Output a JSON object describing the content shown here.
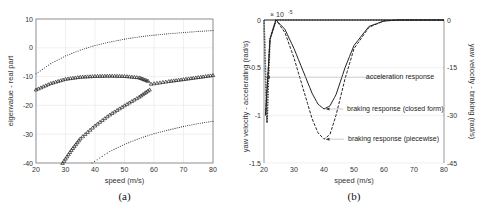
{
  "chart_data": [
    {
      "type": "scatter",
      "panel": "(a)",
      "caption": "(a)",
      "xlabel": "speed (m/s)",
      "ylabel": "eigenvalue - real part",
      "xlim": [
        20,
        80
      ],
      "ylim": [
        -40,
        10
      ],
      "xticks": [
        20,
        30,
        40,
        50,
        60,
        70,
        80
      ],
      "yticks": [
        10,
        0,
        -10,
        -20,
        -30,
        -40
      ],
      "grid": true,
      "series": [
        {
          "name": "upper dotted",
          "style": "dotted",
          "x": [
            20,
            25,
            30,
            35,
            40,
            45,
            50,
            55,
            60,
            65,
            70,
            75,
            80
          ],
          "y": [
            -9,
            -5.5,
            -2.8,
            -0.8,
            0.8,
            2.0,
            3.0,
            3.8,
            4.4,
            4.9,
            5.3,
            5.7,
            6
          ]
        },
        {
          "name": "triangles upper branch",
          "style": "triangle",
          "x": [
            20,
            25,
            30,
            35,
            40,
            45,
            50,
            55,
            58
          ],
          "y": [
            -14.5,
            -12.3,
            -10.8,
            -10.1,
            -9.8,
            -9.7,
            -9.8,
            -10.3,
            -11.5
          ]
        },
        {
          "name": "triangles lower branch",
          "style": "triangle",
          "x": [
            29,
            32,
            35,
            40,
            45,
            50,
            55,
            58.5
          ],
          "y": [
            -40,
            -35.5,
            -31.5,
            -27,
            -23.2,
            -20,
            -17,
            -14.5
          ]
        },
        {
          "name": "triangles merged",
          "style": "triangle",
          "x": [
            59,
            65,
            70,
            75,
            80
          ],
          "y": [
            -12.5,
            -11.6,
            -10.9,
            -10.2,
            -9.5
          ]
        },
        {
          "name": "lower dotted",
          "style": "dotted",
          "x": [
            39,
            45,
            50,
            55,
            60,
            65,
            70,
            75,
            80
          ],
          "y": [
            -40,
            -36,
            -33.5,
            -31.5,
            -29.8,
            -28.5,
            -27.3,
            -26.3,
            -25.5
          ]
        }
      ]
    },
    {
      "type": "line",
      "panel": "(b)",
      "caption": "(b)",
      "xlabel": "speed (m/s)",
      "ylabel_left": "yaw velocity - accelerating (rad/s)",
      "ylabel_right": "yaw velocity - braking (rad/s)",
      "left_scale_label": "× 10^-5",
      "xlim": [
        20,
        80
      ],
      "ylim_left": [
        -1.5,
        0
      ],
      "ylim_right": [
        -45,
        0
      ],
      "xticks": [
        20,
        30,
        40,
        50,
        60,
        70,
        80
      ],
      "yticks_left": [
        0,
        -0.5,
        -1,
        -1.5
      ],
      "yticks_right": [
        0,
        -15,
        -30,
        -45
      ],
      "grid": true,
      "annotations": [
        "acceleration response",
        "braking response (closed form)",
        "braking response (piecewise)"
      ],
      "series": [
        {
          "name": "acceleration response",
          "style": "dotted",
          "x": [
            20,
            20.3,
            20.6,
            21,
            21.5,
            22,
            24,
            30,
            80
          ],
          "y": [
            0,
            -0.3,
            -0.7,
            -1.08,
            -0.6,
            -0.2,
            0,
            0,
            0
          ]
        },
        {
          "name": "braking response (closed form)",
          "axis": "right",
          "style": "solid",
          "x": [
            20.5,
            22,
            24,
            27,
            30,
            33,
            36,
            38,
            40,
            42,
            44,
            47,
            50,
            55,
            60,
            65,
            80
          ],
          "y": [
            -30,
            -6,
            0,
            -3,
            -9,
            -16,
            -23,
            -26.5,
            -28,
            -27,
            -23.5,
            -15,
            -8,
            -2,
            -0.3,
            0,
            0
          ]
        },
        {
          "name": "braking response (piecewise)",
          "axis": "right",
          "style": "dashed",
          "x": [
            20.5,
            22,
            24,
            27,
            30,
            33,
            36,
            38,
            40,
            42,
            44,
            47,
            50,
            55,
            60,
            65,
            80
          ],
          "y": [
            -30,
            -6,
            0,
            -4,
            -12,
            -21.5,
            -31,
            -35.5,
            -37.5,
            -36,
            -30,
            -18.5,
            -9,
            -2.3,
            -0.3,
            0,
            0
          ]
        }
      ]
    }
  ]
}
